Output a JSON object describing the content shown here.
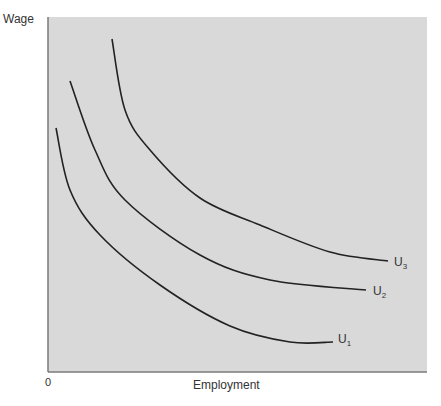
{
  "chart_data": {
    "type": "line",
    "title": "",
    "xlabel": "Employment",
    "ylabel": "Wage",
    "origin_label": "0",
    "grid": false,
    "legend": "inline labels at curve ends",
    "colors": {
      "plot_bg": "#d9d9d9",
      "line": "#222222",
      "border": "#7a7a7a"
    },
    "series": [
      {
        "name": "U1",
        "base": "U",
        "sub": "1",
        "points": [
          [
            56,
            128
          ],
          [
            70,
            190
          ],
          [
            100,
            235
          ],
          [
            160,
            285
          ],
          [
            230,
            326
          ],
          [
            290,
            342
          ],
          [
            333,
            342
          ]
        ],
        "label_pos": [
          338,
          332
        ]
      },
      {
        "name": "U2",
        "base": "U",
        "sub": "2",
        "points": [
          [
            70,
            81
          ],
          [
            95,
            150
          ],
          [
            125,
            200
          ],
          [
            200,
            255
          ],
          [
            270,
            280
          ],
          [
            366,
            290
          ]
        ],
        "label_pos": [
          373,
          284
        ]
      },
      {
        "name": "U3",
        "base": "U",
        "sub": "3",
        "points": [
          [
            112,
            39
          ],
          [
            125,
            110
          ],
          [
            150,
            150
          ],
          [
            200,
            198
          ],
          [
            260,
            225
          ],
          [
            330,
            252
          ],
          [
            388,
            261
          ]
        ],
        "label_pos": [
          394,
          255
        ]
      }
    ]
  }
}
